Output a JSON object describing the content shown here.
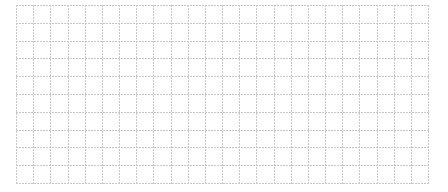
{
  "grid": {
    "columns": 24,
    "rows": 10,
    "line_color": "#c8c8c8",
    "background": "#ffffff"
  }
}
